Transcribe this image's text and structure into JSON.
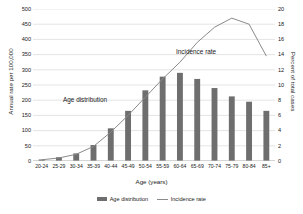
{
  "chart_data": {
    "type": "bar",
    "title": "",
    "xlabel": "Age (years)",
    "ylabel": "Annual rate per 100,000",
    "y2label": "Percent of total cases",
    "categories": [
      "20-24",
      "25-29",
      "30-34",
      "35-39",
      "40-44",
      "45-49",
      "50-54",
      "55-59",
      "60-64",
      "65-69",
      "70-74",
      "75-79",
      "80-84",
      "85+"
    ],
    "ylim": [
      0,
      500
    ],
    "y2lim": [
      0,
      20
    ],
    "yticks": [
      "0",
      "50",
      "100",
      "150",
      "200",
      "250",
      "300",
      "350",
      "400",
      "450",
      "500"
    ],
    "y2ticks": [
      "0",
      "2",
      "4",
      "6",
      "8",
      "10",
      "12",
      "14",
      "16",
      "18",
      "20"
    ],
    "grid": true,
    "legend_position": "bottom",
    "series": [
      {
        "name": "Age distribution",
        "type": "bar",
        "axis": "right",
        "unit": "percent of total cases",
        "color": "#6e6e6e",
        "values": [
          0.2,
          0.5,
          1.0,
          2.1,
          4.3,
          6.6,
          9.3,
          11.1,
          11.6,
          10.8,
          9.6,
          8.5,
          7.8,
          6.6
        ]
      },
      {
        "name": "Incidence rate",
        "type": "line",
        "axis": "left",
        "unit": "annual rate per 100,000",
        "color": "#8a8a8a",
        "values": [
          4,
          10,
          22,
          48,
          95,
          150,
          210,
          270,
          325,
          390,
          440,
          470,
          450,
          345
        ]
      }
    ],
    "annotations": [
      {
        "text": "Age distribution",
        "x": "45-49",
        "y": 260
      },
      {
        "text": "Incidence rate",
        "x": "70-74",
        "y": 405
      }
    ],
    "legend": [
      {
        "label": "Age distribution",
        "marker": "bar",
        "color": "#6e6e6e"
      },
      {
        "label": "Incidence rate",
        "marker": "line",
        "color": "#8a8a8a"
      }
    ]
  },
  "colors": {
    "bar": "#6e6e6e",
    "line": "#8a8a8a",
    "grid": "#d9d9d9",
    "axis": "#bfbfbf",
    "text": "#1a1a1a",
    "background": "#ffffff"
  }
}
